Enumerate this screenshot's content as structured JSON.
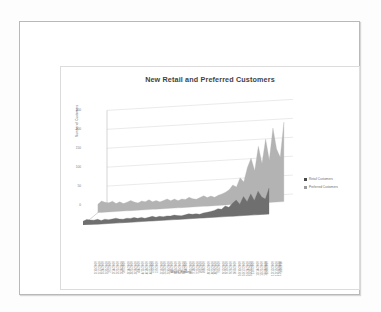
{
  "document": {
    "kind": "scanned-page-with-chart"
  },
  "chart": {
    "title": "New Retail and Preferred Customers",
    "x_axis_title": "Week Ending",
    "y_axis_title": "Number of Customers",
    "legend": [
      {
        "label": "Retail Customers",
        "color": "#4a4a4a"
      },
      {
        "label": "Preferred Customers",
        "color": "#9b9b9b"
      }
    ],
    "colors": {
      "back_series_fill": "#b3b3b3",
      "front_series_fill": "#6f6f6f",
      "gridline": "#c9c9c9",
      "axis": "#a8a8a8",
      "title_text": "#3f3f3f",
      "tick_text": "#7b7b7b"
    }
  },
  "chart_data": {
    "type": "area",
    "title": "New Retail and Preferred Customers",
    "xlabel": "Week Ending",
    "ylabel": "Number of Customers",
    "ylim": [
      0,
      250
    ],
    "yticks": [
      0,
      50,
      100,
      150,
      200,
      250
    ],
    "grid": true,
    "legend_position": "right",
    "three_d": true,
    "categories": [
      "1/10/2009",
      "1/17/2009",
      "1/24/2009",
      "1/31/2009",
      "2/7/2009",
      "2/14/2009",
      "2/21/2009",
      "2/28/2009",
      "3/7/2009",
      "3/14/2009",
      "3/21/2009",
      "3/28/2009",
      "4/4/2009",
      "4/11/2009",
      "4/18/2009",
      "4/25/2009",
      "5/2/2009",
      "5/9/2009",
      "5/16/2009",
      "5/23/2009",
      "5/30/2009",
      "6/6/2009",
      "6/13/2009",
      "6/20/2009",
      "6/27/2009",
      "7/4/2009",
      "7/11/2009",
      "7/18/2009",
      "7/25/2009",
      "8/1/2009",
      "8/8/2009",
      "8/15/2009",
      "8/22/2009",
      "8/29/2009",
      "9/5/2009",
      "9/12/2009",
      "9/19/2009",
      "9/26/2009",
      "10/3/2009",
      "10/10/2009",
      "10/17/2009",
      "10/24/2009",
      "10/31/2009",
      "11/7/2009",
      "11/14/2009",
      "11/21/2009",
      "11/28/2009",
      "12/5/2009",
      "12/12/2009",
      "12/19/2009",
      "12/26/2009",
      "1/2/2010"
    ],
    "series": [
      {
        "name": "Preferred Customers",
        "color": "#b3b3b3",
        "values": [
          22,
          30,
          26,
          24,
          28,
          21,
          25,
          20,
          23,
          27,
          22,
          19,
          24,
          21,
          26,
          20,
          23,
          18,
          22,
          25,
          20,
          24,
          19,
          23,
          21,
          26,
          22,
          20,
          24,
          28,
          23,
          26,
          22,
          27,
          30,
          34,
          40,
          52,
          46,
          70,
          58,
          96,
          120,
          86,
          150,
          104,
          168,
          112,
          196,
          140,
          118,
          210
        ]
      },
      {
        "name": "Retail Customers",
        "color": "#6f6f6f",
        "values": [
          10,
          14,
          12,
          11,
          13,
          9,
          12,
          10,
          11,
          13,
          10,
          9,
          11,
          10,
          12,
          9,
          11,
          8,
          10,
          12,
          9,
          11,
          9,
          11,
          10,
          12,
          10,
          9,
          11,
          13,
          11,
          12,
          10,
          13,
          14,
          16,
          18,
          22,
          20,
          28,
          24,
          34,
          42,
          30,
          50,
          36,
          56,
          38,
          62,
          46,
          40,
          68
        ]
      }
    ]
  }
}
